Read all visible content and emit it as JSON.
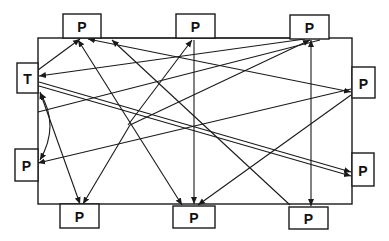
{
  "diagram": {
    "type": "network",
    "frame": {
      "x": 38,
      "y": 38,
      "width": 314,
      "height": 166
    },
    "nodes": [
      {
        "id": "T",
        "label": "T",
        "x": 17,
        "y": 63,
        "w": 21,
        "h": 30
      },
      {
        "id": "P1",
        "label": "P",
        "x": 63,
        "y": 14,
        "w": 38,
        "h": 24
      },
      {
        "id": "P2",
        "label": "P",
        "x": 176,
        "y": 14,
        "w": 39,
        "h": 24
      },
      {
        "id": "P3",
        "label": "P",
        "x": 290,
        "y": 15,
        "w": 39,
        "h": 24
      },
      {
        "id": "P4",
        "label": "P",
        "x": 352,
        "y": 67,
        "w": 23,
        "h": 31
      },
      {
        "id": "P5",
        "label": "P",
        "x": 352,
        "y": 153,
        "w": 22,
        "h": 33
      },
      {
        "id": "P6",
        "label": "P",
        "x": 289,
        "y": 207,
        "w": 39,
        "h": 22
      },
      {
        "id": "P7",
        "label": "P",
        "x": 173,
        "y": 206,
        "w": 42,
        "h": 22
      },
      {
        "id": "P8",
        "label": "P",
        "x": 60,
        "y": 204,
        "w": 39,
        "h": 24
      },
      {
        "id": "P9",
        "label": "P",
        "x": 15,
        "y": 149,
        "w": 23,
        "h": 32
      }
    ],
    "edges": [
      {
        "from": [
          38,
          70
        ],
        "to": [
          80,
          39
        ],
        "arrow_end": true,
        "arrow_start": false
      },
      {
        "from": [
          305,
          39
        ],
        "to": [
          39,
          76
        ],
        "arrow_end": true,
        "arrow_start": false
      },
      {
        "from": [
          39,
          82
        ],
        "to": [
          351,
          172
        ],
        "arrow_end": true,
        "arrow_start": false
      },
      {
        "from": [
          39,
          86
        ],
        "to": [
          351,
          176
        ],
        "arrow_end": true,
        "arrow_start": false
      },
      {
        "from": [
          40,
          92
        ],
        "to": [
          80,
          204
        ],
        "arrow_end": true,
        "arrow_start": true
      },
      {
        "from": [
          78,
          40
        ],
        "to": [
          182,
          205
        ],
        "arrow_end": true,
        "arrow_start": true
      },
      {
        "from": [
          88,
          39
        ],
        "to": [
          351,
          92
        ],
        "arrow_end": true,
        "arrow_start": true
      },
      {
        "from": [
          112,
          40
        ],
        "to": [
          290,
          205
        ],
        "arrow_end": false,
        "arrow_start": true
      },
      {
        "from": [
          194,
          40
        ],
        "to": [
          194,
          204
        ],
        "arrow_end": true,
        "arrow_start": false
      },
      {
        "from": [
          100,
          38
        ],
        "to": [
          330,
          38
        ],
        "arrow_end": false,
        "arrow_start": false
      },
      {
        "from": [
          38,
          163
        ],
        "to": [
          351,
          89
        ],
        "arrow_end": false,
        "arrow_start": true
      },
      {
        "from": [
          128,
          125
        ],
        "to": [
          192,
          40
        ],
        "arrow_end": true,
        "arrow_start": false
      },
      {
        "from": [
          130,
          125
        ],
        "to": [
          310,
          40
        ],
        "arrow_end": true,
        "arrow_start": false
      },
      {
        "from": [
          130,
          125
        ],
        "to": [
          83,
          204
        ],
        "arrow_end": true,
        "arrow_start": false
      },
      {
        "from": [
          351,
          95
        ],
        "to": [
          198,
          205
        ],
        "arrow_end": true,
        "arrow_start": false
      },
      {
        "from": [
          311,
          40
        ],
        "to": [
          311,
          206
        ],
        "arrow_end": true,
        "arrow_start": true
      },
      {
        "from": [
          38,
          112
        ],
        "to": [
          320,
          40
        ],
        "arrow_end": false,
        "arrow_start": false
      }
    ],
    "curved_edges": [
      {
        "from": [
          40,
          93
        ],
        "control": [
          60,
          125
        ],
        "to": [
          40,
          160
        ],
        "arrow_start": true,
        "arrow_end": true
      }
    ]
  }
}
